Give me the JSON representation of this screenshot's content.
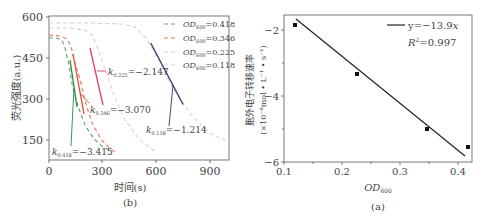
{
  "chart_data": [
    {
      "id": "b",
      "type": "line",
      "caption": "(b)",
      "title": "",
      "xlabel": "时间(s)",
      "ylabel": "荧光强度(a.u.)",
      "xlim": [
        0,
        1000
      ],
      "ylim": [
        80,
        600
      ],
      "xticks": [
        0,
        300,
        600,
        900
      ],
      "yticks": [
        150,
        300,
        450,
        600
      ],
      "grid": false,
      "legend_position": "upper right",
      "series": [
        {
          "name": "OD600=0.418",
          "color": "#6a9a78",
          "style": "dashed",
          "x": [
            0,
            40,
            70,
            90,
            110,
            130,
            160,
            200,
            250,
            300,
            340
          ],
          "y": [
            520,
            520,
            510,
            480,
            420,
            350,
            270,
            200,
            150,
            120,
            105
          ]
        },
        {
          "name": "OD600=0.346",
          "color": "#e8785a",
          "style": "dashed",
          "x": [
            0,
            60,
            100,
            120,
            140,
            170,
            200,
            240,
            290,
            340,
            380
          ],
          "y": [
            530,
            528,
            515,
            490,
            440,
            370,
            290,
            210,
            150,
            115,
            100
          ]
        },
        {
          "name": "OD600=0.225",
          "color": "#e0c8c8",
          "style": "dashed",
          "x": [
            0,
            100,
            200,
            240,
            280,
            320,
            360,
            420,
            500,
            580,
            600
          ],
          "y": [
            555,
            555,
            550,
            530,
            470,
            390,
            310,
            220,
            150,
            110,
            100
          ]
        },
        {
          "name": "OD600=0.118",
          "color": "#e4cccc",
          "style": "dashed",
          "x": [
            0,
            200,
            400,
            480,
            540,
            600,
            660,
            720,
            800,
            900,
            1000
          ],
          "y": [
            575,
            575,
            572,
            560,
            520,
            450,
            370,
            300,
            230,
            170,
            140
          ]
        }
      ],
      "fit_lines": [
        {
          "label": "k0.225=−2.147",
          "color": "#e04060",
          "x": [
            230,
            300
          ],
          "y": [
            490,
            315
          ]
        },
        {
          "label": "k0.346=−3.070",
          "color": "#e05030",
          "x": [
            130,
            190
          ],
          "y": [
            465,
            250
          ]
        },
        {
          "label": "k0.418=−3.415",
          "color": "#2a8a40",
          "x": [
            115,
            155
          ],
          "y": [
            445,
            275
          ]
        },
        {
          "label": "k0.118=−1.214",
          "color": "#223a6a",
          "x": [
            565,
            745
          ],
          "y": [
            505,
            280
          ]
        }
      ],
      "annotations": [
        {
          "text": "k",
          "sub": "0.225",
          "value": "=−2.147"
        },
        {
          "text": "k",
          "sub": "0.346",
          "value": "=−3.070"
        },
        {
          "text": "k",
          "sub": "0.418",
          "value": "=−3.415"
        },
        {
          "text": "k",
          "sub": "0.118",
          "value": "=−1.214"
        }
      ]
    },
    {
      "id": "a",
      "type": "scatter",
      "caption": "(a)",
      "title": "",
      "xlabel": "OD600",
      "ylabel": "胞外电子转移速率",
      "ylabel_units": "(×10⁻⁸mol • L⁻¹ • s⁻¹)",
      "xlim": [
        0.1,
        0.424
      ],
      "ylim": [
        -6,
        -1.55
      ],
      "xticks": [
        0.1,
        0.2,
        0.3,
        0.4
      ],
      "yticks": [
        -2,
        -4,
        -6
      ],
      "grid": false,
      "legend_position": "upper right",
      "points": {
        "x": [
          0.118,
          0.225,
          0.346,
          0.418
        ],
        "y": [
          -1.85,
          -3.3,
          -5.0,
          -5.55
        ]
      },
      "fit": {
        "label": "y=−13.9x",
        "r2_label": "R²=0.997",
        "x": [
          0.118,
          0.418
        ],
        "y": [
          -1.68,
          -5.83
        ]
      }
    }
  ],
  "figure_b": {
    "caption": "(b)",
    "xlabel": "时间(s)",
    "ylabel": "荧光强度(a.u.)",
    "xtick_labels": [
      "0",
      "300",
      "600",
      "900"
    ],
    "ytick_labels": [
      "150",
      "300",
      "450",
      "600"
    ],
    "legend": [
      {
        "prefix": "OD",
        "sub": "600",
        "value": "=0.418"
      },
      {
        "prefix": "OD",
        "sub": "600",
        "value": "=0.346"
      },
      {
        "prefix": "OD",
        "sub": "600",
        "value": "=0.225"
      },
      {
        "prefix": "OD",
        "sub": "600",
        "value": "=0.118"
      }
    ],
    "annotations": [
      {
        "k": "k",
        "sub": "0.225",
        "value": "=−2.147"
      },
      {
        "k": "k",
        "sub": "0.346",
        "value": "=−3.070"
      },
      {
        "k": "k",
        "sub": "0.418",
        "value": "=−3.415"
      },
      {
        "k": "k",
        "sub": "0.118",
        "value": "=−1.214"
      }
    ]
  },
  "figure_a": {
    "caption": "(a)",
    "xlabel_main": "OD",
    "xlabel_sub": "600",
    "ylabel_line1": "胞外电子转移速率",
    "ylabel_line2": "(×10⁻⁸mol • L⁻¹ • s⁻¹)",
    "xtick_labels": [
      "0.1",
      "0.2",
      "0.3",
      "0.4"
    ],
    "ytick_labels": [
      "−2",
      "−4",
      "−6"
    ],
    "legend_fit": "y=−13.9",
    "legend_fit_var": "x",
    "legend_r2_main": "R",
    "legend_r2_sup": "2",
    "legend_r2_value": "=0.997"
  }
}
